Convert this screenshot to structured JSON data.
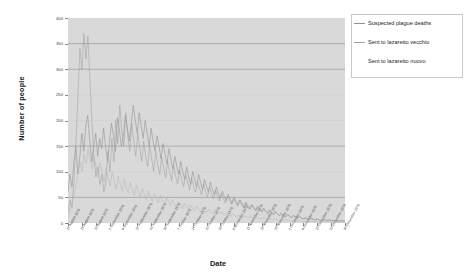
{
  "chart_data": {
    "type": "line",
    "title": "",
    "xlabel": "Date",
    "ylabel": "Number of people",
    "ylim": [
      0,
      400
    ],
    "ytick_values": [
      0,
      50,
      100,
      150,
      200,
      250,
      300,
      350,
      400
    ],
    "ytick_labels": [
      "0",
      "50",
      "100",
      "150",
      "200",
      "250",
      "300",
      "350",
      "400"
    ],
    "grid": true,
    "grid_axis": "y",
    "legend_position": "top-right",
    "x_tick_labels": [
      "12 August 1576",
      "19 August 1576",
      "26 August 1576",
      "2 September 1576",
      "9 September 1576",
      "16 September 1576",
      "23 September 1576",
      "30 September 1576",
      "7 October 1576",
      "14 October 1576",
      "21 October 1576",
      "28 October 1576",
      "4 November 1576",
      "11 November 1576",
      "18 November 1576",
      "25 November 1576",
      "2 December 1576",
      "9 December 1576",
      "16 December 1576",
      "23 December 1576",
      "30 December 1576"
    ],
    "series": [
      {
        "name": "Suspected plague deaths",
        "color": "#8d8d8d",
        "values": [
          60,
          95,
          70,
          120,
          150,
          95,
          130,
          175,
          140,
          190,
          210,
          160,
          120,
          150,
          175,
          130,
          165,
          145,
          185,
          150,
          120,
          160,
          195,
          170,
          140,
          205,
          180,
          150,
          170,
          210,
          185,
          160,
          195,
          230,
          200,
          175,
          215,
          190,
          165,
          200,
          175,
          150,
          185,
          160,
          140,
          170,
          150,
          125,
          155,
          135,
          115,
          145,
          125,
          105,
          130,
          110,
          95,
          120,
          100,
          85,
          110,
          90,
          75,
          100,
          85,
          70,
          95,
          80,
          65,
          85,
          70,
          60,
          80,
          65,
          55,
          70,
          58,
          48,
          62,
          52,
          44,
          56,
          46,
          38,
          50,
          42,
          35,
          45,
          38,
          30,
          40,
          33,
          27,
          36,
          30,
          24,
          32,
          26,
          21,
          28,
          23,
          18,
          24,
          20,
          16,
          21,
          17,
          14,
          18,
          15,
          12,
          16,
          13,
          10,
          14,
          11,
          9,
          12,
          10,
          8,
          10,
          8,
          7,
          9,
          7,
          6,
          8,
          6,
          5,
          7,
          6,
          5,
          6,
          5,
          4,
          5,
          4,
          4,
          5,
          4,
          3
        ]
      },
      {
        "name": "Sent to lazaretto vecchio",
        "color": "#a0a0a0",
        "values": [
          20,
          45,
          30,
          80,
          160,
          250,
          340,
          300,
          370,
          320,
          365,
          280,
          200,
          130,
          90,
          110,
          75,
          95,
          60,
          80,
          140,
          100,
          165,
          120,
          200,
          155,
          230,
          180,
          150,
          215,
          170,
          140,
          195,
          160,
          130,
          175,
          145,
          120,
          160,
          130,
          110,
          150,
          125,
          100,
          140,
          115,
          95,
          130,
          108,
          88,
          120,
          100,
          82,
          112,
          92,
          76,
          104,
          86,
          70,
          96,
          80,
          65,
          88,
          72,
          60,
          82,
          68,
          55,
          76,
          62,
          50,
          70,
          58,
          47,
          64,
          53,
          43,
          58,
          48,
          39,
          53,
          44,
          36,
          48,
          40,
          33,
          44,
          36,
          30,
          40,
          33,
          27,
          36,
          30,
          24,
          32,
          27,
          22,
          29,
          24,
          20,
          26,
          21,
          17,
          23,
          19,
          15,
          20,
          16,
          13,
          17,
          14,
          11,
          15,
          12,
          10,
          13,
          10,
          8,
          11,
          9,
          7,
          9,
          8,
          6,
          8,
          6,
          5,
          7,
          6,
          5,
          6,
          5,
          4,
          5,
          4,
          4,
          4,
          4,
          3
        ]
      },
      {
        "name": "Sent to lazaretto nuovo",
        "color": "#b5b5b5",
        "values": [
          10,
          25,
          40,
          55,
          75,
          95,
          120,
          100,
          135,
          115,
          145,
          125,
          105,
          130,
          110,
          90,
          118,
          98,
          80,
          108,
          88,
          72,
          100,
          82,
          66,
          92,
          76,
          62,
          86,
          70,
          58,
          80,
          66,
          54,
          74,
          61,
          50,
          68,
          56,
          46,
          63,
          52,
          42,
          58,
          48,
          39,
          54,
          44,
          36,
          50,
          41,
          34,
          46,
          38,
          31,
          42,
          35,
          28,
          39,
          32,
          26,
          36,
          29,
          24,
          33,
          27,
          22,
          30,
          25,
          20,
          27,
          22,
          18,
          25,
          20,
          17,
          22,
          18,
          15,
          20,
          16,
          13,
          18,
          15,
          12,
          16,
          13,
          11,
          14,
          12,
          10,
          13,
          10,
          8,
          11,
          9,
          8,
          10,
          8,
          7,
          9,
          7,
          6,
          8,
          6,
          5,
          7,
          6,
          5,
          6,
          5,
          4,
          5,
          4,
          4,
          5,
          4,
          3,
          4,
          3,
          3,
          4,
          3,
          3,
          3,
          3,
          2,
          3,
          2,
          2,
          3,
          2,
          2,
          2,
          2,
          2,
          2,
          2,
          2
        ]
      }
    ]
  },
  "legend": {
    "items": [
      {
        "label": "Suspected plague deaths",
        "color": "#8d8d8d"
      },
      {
        "label": "Sent to lazaretto vecchio",
        "color": "#a0a0a0"
      },
      {
        "label": "Sent to lazaretto nuovo",
        "color": "#b5b5b5"
      }
    ]
  },
  "axis_titles": {
    "y": "Number of people",
    "x": "Date"
  }
}
